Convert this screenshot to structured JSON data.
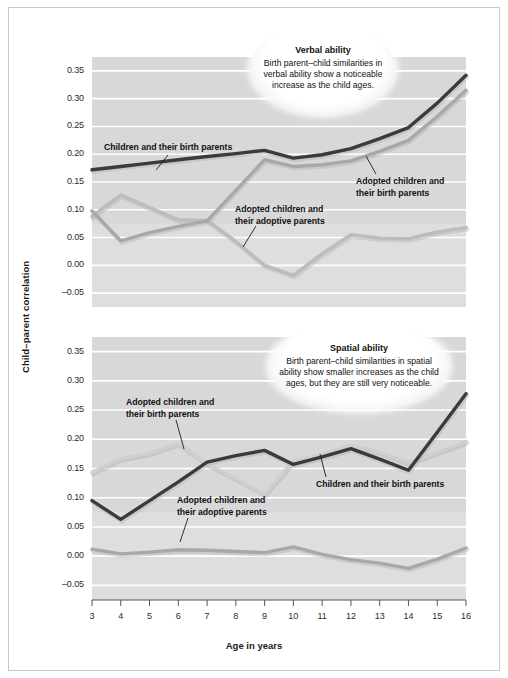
{
  "figure": {
    "axis_y_title": "Child–parent correlation",
    "axis_x_title": "Age in years"
  },
  "callouts": {
    "verbal": {
      "title": "Verbal ability",
      "body": "Birth parent–child similarities in verbal ability show a noticeable increase as the child ages."
    },
    "spatial": {
      "title": "Spatial ability",
      "body": "Birth parent–child similarities in spatial ability show smaller increases as the child ages, but they are still very noticeable."
    }
  },
  "annotations": {
    "verbal_birth_children": "Children and their birth parents",
    "verbal_adopted_birth_l1": "Adopted children and",
    "verbal_adopted_birth_l2": "their birth parents",
    "verbal_adopted_adoptive_l1": "Adopted children and",
    "verbal_adopted_adoptive_l2": "their adoptive parents",
    "spatial_adopted_birth_l1": "Adopted children and",
    "spatial_adopted_birth_l2": "their birth parents",
    "spatial_adopted_adoptive_l1": "Adopted children and",
    "spatial_adopted_adoptive_l2": "their adoptive parents",
    "spatial_birth_children": "Children and their birth parents"
  },
  "colors": {
    "series_dark": "#3b3b3b",
    "series_mid": "#a8a8a8",
    "series_light": "#cfcfcf",
    "plot_band": "#d8d8d8",
    "plot_band_alt": "#e4e4e4",
    "gridline": "#ffffff",
    "axis": "#555555",
    "text": "#1b1b1b"
  },
  "chart_data": [
    {
      "type": "line",
      "title": "Verbal ability",
      "xlabel": "Age in years",
      "ylabel": "Child–parent correlation",
      "xlim": [
        3,
        16
      ],
      "ylim": [
        -0.075,
        0.375
      ],
      "yticks": [
        -0.05,
        0.0,
        0.05,
        0.1,
        0.15,
        0.2,
        0.25,
        0.3,
        0.35
      ],
      "ytick_labels": [
        "-0.05",
        "0.00",
        "0.05",
        "0.10",
        "0.15",
        "0.20",
        "0.25",
        "0.30",
        "0.35"
      ],
      "x": [
        3,
        4,
        5,
        6,
        7,
        8,
        9,
        10,
        11,
        12,
        13,
        14,
        15,
        16
      ],
      "xtick_labels": [
        "3",
        "4",
        "5",
        "6",
        "7",
        "8",
        "9",
        "10",
        "11",
        "12",
        "13",
        "14",
        "15",
        "16"
      ],
      "grid": true,
      "legend": "annotated-inline",
      "series": [
        {
          "name": "Children and their birth parents",
          "color": "#3b3b3b",
          "values": [
            0.172,
            0.178,
            0.184,
            0.19,
            0.196,
            0.201,
            0.207,
            0.193,
            0.199,
            0.21,
            0.228,
            0.248,
            0.292,
            0.342
          ]
        },
        {
          "name": "Adopted children and their birth parents",
          "color": "#a8a8a8",
          "values": [
            0.098,
            0.044,
            0.059,
            0.07,
            0.08,
            0.135,
            0.19,
            0.178,
            0.181,
            0.188,
            0.205,
            0.225,
            0.268,
            0.315
          ]
        },
        {
          "name": "Adopted children and their adoptive parents",
          "color": "#bcbcbc",
          "values": [
            0.088,
            0.127,
            0.104,
            0.082,
            0.081,
            0.043,
            0.0,
            -0.018,
            0.021,
            0.055,
            0.049,
            0.048,
            0.06,
            0.068
          ]
        }
      ]
    },
    {
      "type": "line",
      "title": "Spatial ability",
      "xlabel": "Age in years",
      "ylabel": "Child–parent correlation",
      "xlim": [
        3,
        16
      ],
      "ylim": [
        -0.075,
        0.375
      ],
      "yticks": [
        -0.05,
        0.0,
        0.05,
        0.1,
        0.15,
        0.2,
        0.25,
        0.3,
        0.35
      ],
      "ytick_labels": [
        "-0.05",
        "0.00",
        "0.05",
        "0.10",
        "0.15",
        "0.20",
        "0.25",
        "0.30",
        "0.35"
      ],
      "x": [
        3,
        4,
        5,
        6,
        7,
        8,
        9,
        10,
        11,
        12,
        13,
        14,
        15,
        16
      ],
      "xtick_labels": [
        "3",
        "4",
        "5",
        "6",
        "7",
        "8",
        "9",
        "10",
        "11",
        "12",
        "13",
        "14",
        "15",
        "16"
      ],
      "grid": true,
      "legend": "annotated-inline",
      "series": [
        {
          "name": "Children and their birth parents",
          "color": "#3b3b3b",
          "values": [
            0.095,
            0.063,
            0.095,
            0.127,
            0.161,
            0.172,
            0.181,
            0.157,
            0.17,
            0.184,
            0.166,
            0.147,
            0.212,
            0.278
          ]
        },
        {
          "name": "Adopted children and their birth parents",
          "color": "#cfcfcf",
          "values": [
            0.143,
            0.167,
            0.176,
            0.193,
            0.158,
            0.133,
            0.106,
            0.163,
            0.174,
            0.19,
            0.178,
            0.16,
            0.178,
            0.196
          ]
        },
        {
          "name": "Adopted children and their adoptive parents",
          "color": "#a8a8a8",
          "values": [
            0.012,
            0.004,
            0.007,
            0.011,
            0.01,
            0.008,
            0.006,
            0.016,
            0.003,
            -0.006,
            -0.012,
            -0.021,
            -0.005,
            0.014
          ]
        }
      ]
    }
  ]
}
